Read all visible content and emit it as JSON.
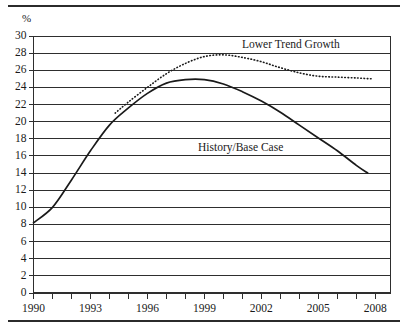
{
  "figure": {
    "unit_label": "%",
    "top_rule": "rule",
    "bottom_rule": "rule"
  },
  "chart_data": {
    "type": "line",
    "title": "",
    "subtitle": "",
    "xlabel": "",
    "ylabel": "%",
    "grid": true,
    "legend_position": "inline-annotation",
    "xlim": [
      1990,
      2008.8
    ],
    "ylim": [
      0,
      30
    ],
    "ytick_step": 2,
    "yticks": [
      0,
      2,
      4,
      6,
      8,
      10,
      12,
      14,
      16,
      18,
      20,
      22,
      24,
      26,
      28,
      30
    ],
    "xticks": [
      1990,
      1991,
      1992,
      1993,
      1994,
      1995,
      1996,
      1997,
      1998,
      1999,
      2000,
      2001,
      2002,
      2003,
      2004,
      2005,
      2006,
      2007,
      2008
    ],
    "xtick_labels": [
      "1990",
      "1993",
      "1996",
      "1999",
      "2002",
      "2005",
      "2008"
    ],
    "xtick_labels_years": [
      1990,
      1993,
      1996,
      1999,
      2002,
      2005,
      2008
    ],
    "series": [
      {
        "name": "History/Base Case",
        "style": "solid",
        "color": "#1a1a1a",
        "x": [
          1990,
          1991,
          1992,
          1993,
          1994,
          1995,
          1996,
          1997,
          1998,
          1999,
          2000,
          2001,
          2002,
          2003,
          2004,
          2005,
          2006,
          2007,
          2007.6
        ],
        "values": [
          8.2,
          10.0,
          13.2,
          16.6,
          19.6,
          21.6,
          23.3,
          24.5,
          24.9,
          24.9,
          24.4,
          23.5,
          22.4,
          21.1,
          19.6,
          18.1,
          16.6,
          14.9,
          14.0
        ]
      },
      {
        "name": "Lower Trend Growth",
        "style": "dotted",
        "color": "#1a1a1a",
        "x": [
          1994.3,
          1995,
          1996,
          1997,
          1998,
          1999,
          2000,
          2001,
          2002,
          2003,
          2004,
          2005,
          2006,
          2007,
          2007.8
        ],
        "values": [
          21.0,
          22.3,
          24.0,
          25.6,
          26.8,
          27.6,
          27.8,
          27.5,
          27.0,
          26.3,
          25.7,
          25.3,
          25.2,
          25.1,
          25.0
        ]
      }
    ],
    "annotations": [
      {
        "text": "Lower Trend Growth",
        "x": 2000.5,
        "y": 28.6
      },
      {
        "text": "History/Base Case",
        "x": 1998.4,
        "y": 16.6
      }
    ]
  }
}
